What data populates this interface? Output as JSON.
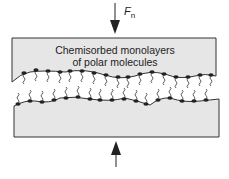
{
  "diagram": {
    "title_line1": "Chemisorbed monolayers",
    "title_line2": "of polar molecules",
    "force_label": "F",
    "force_subscript": "n",
    "colors": {
      "plate_fill": "#e6e6e6",
      "outline": "#333333",
      "molecule": "#222222"
    }
  }
}
